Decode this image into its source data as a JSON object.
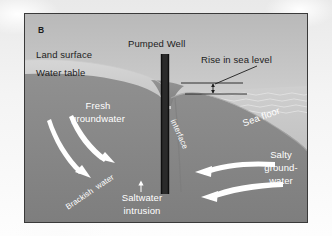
{
  "figure": {
    "panel_label": "B",
    "title_implicit": "Saltwater intrusion into a coastal aquifer with a pumped well and rising sea level",
    "colors": {
      "paper": "#f4f4f4",
      "frame_border": "#3a3a3a",
      "sky_top": "#b9b9b9",
      "sky_bottom": "#e8e8e8",
      "unsaturated_zone": "#cfcfcf",
      "saturated_ground": "#8a8a8a",
      "sea_water": "#c3c3c3",
      "seabed_ground": "#8a8a8a",
      "arrow_white": "#ffffff",
      "well_casing": "#141414",
      "label_dark": "#1d1d1d",
      "label_white": "#ffffff"
    }
  },
  "labels": {
    "panel": "B",
    "land_surface": "Land surface",
    "water_table": "Water table",
    "pumped_well": "Pumped Well",
    "rise_in_sea_level": "Rise in sea level",
    "fresh_groundwater_line1": "Fresh",
    "fresh_groundwater_line2": "groundwater",
    "sea_floor": "Sea floor",
    "salty_groundwater_line1": "Salty",
    "salty_groundwater_line2": "ground-",
    "salty_groundwater_line3": "water",
    "interface": "interface",
    "brackish_water": "Brackish  water",
    "saltwater_intrusion_line1": "Saltwater",
    "saltwater_intrusion_line2": "intrusion"
  },
  "icons": {
    "fresh_arrow_1": "curved-arrow-down-right-icon",
    "fresh_arrow_2": "curved-arrow-down-right-icon",
    "salty_arrow_1": "curved-arrow-left-icon",
    "salty_arrow_2": "curved-arrow-left-icon",
    "intrusion_arrow": "arrow-up-icon",
    "sea_level_rise_arrow": "double-arrow-vertical-icon",
    "leader_line": "leader-line-icon",
    "well_column": "well-casing-icon"
  }
}
